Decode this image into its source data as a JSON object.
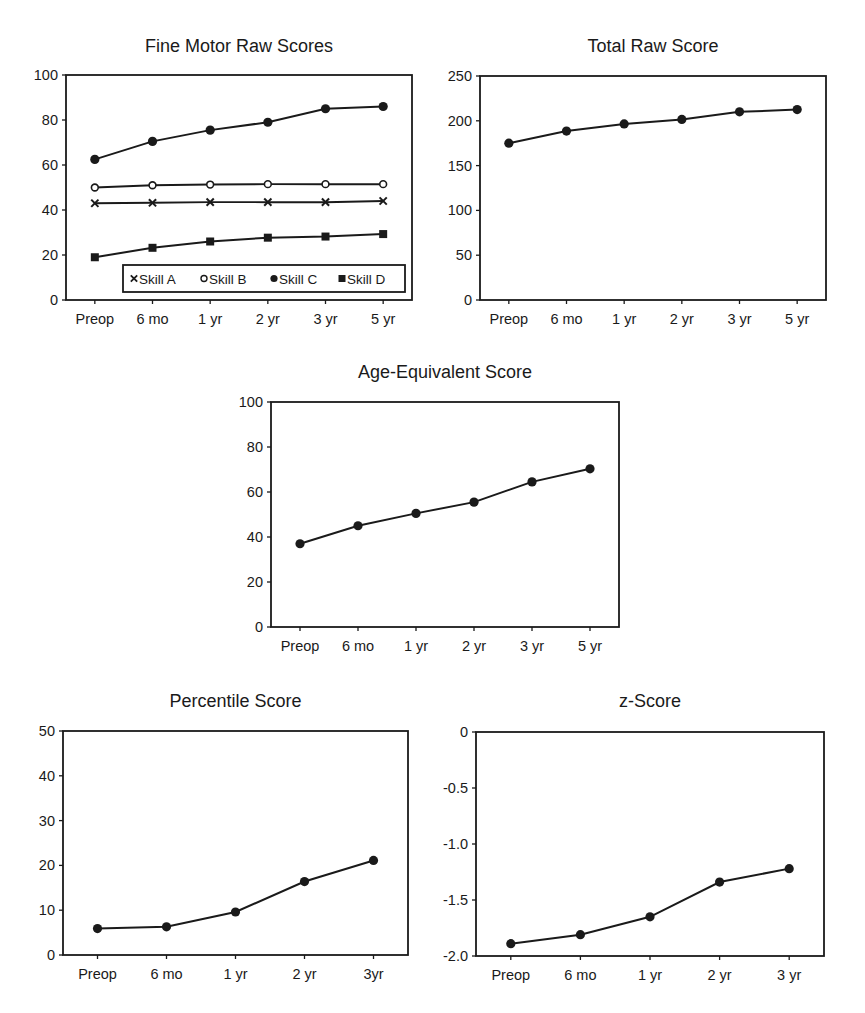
{
  "chart_data": [
    {
      "id": "fine-motor",
      "type": "line",
      "title": "Fine Motor Raw Scores",
      "xlabel": "",
      "ylabel": "",
      "categories": [
        "Preop",
        "6 mo",
        "1 yr",
        "2 yr",
        "3 yr",
        "5 yr"
      ],
      "ylim": [
        0,
        100
      ],
      "yticks": [
        0,
        20,
        40,
        60,
        80,
        100
      ],
      "ytick_labels": [
        "0",
        "20",
        "40",
        "60",
        "80",
        "100"
      ],
      "grid": false,
      "legend": {
        "placement": "bottom-right",
        "orientation": "horizontal"
      },
      "series": [
        {
          "name": "Skill A",
          "marker": "x",
          "values": [
            43,
            43.2,
            43.5,
            43.5,
            43.5,
            44
          ]
        },
        {
          "name": "Skill B",
          "marker": "open-circle",
          "values": [
            50,
            51,
            51.3,
            51.5,
            51.5,
            51.5
          ]
        },
        {
          "name": "Skill C",
          "marker": "filled-circle",
          "values": [
            62.5,
            70.5,
            75.5,
            79,
            85,
            86
          ]
        },
        {
          "name": "Skill D",
          "marker": "filled-square",
          "values": [
            19,
            23.2,
            26,
            27.7,
            28.2,
            29.3
          ]
        }
      ]
    },
    {
      "id": "total-raw",
      "type": "line",
      "title": "Total Raw Score",
      "xlabel": "",
      "ylabel": "",
      "categories": [
        "Preop",
        "6 mo",
        "1 yr",
        "2 yr",
        "3 yr",
        "5 yr"
      ],
      "ylim": [
        0,
        250
      ],
      "yticks": [
        0,
        50,
        100,
        150,
        200,
        250
      ],
      "ytick_labels": [
        "0",
        "50",
        "100",
        "150",
        "200",
        "250"
      ],
      "grid": false,
      "series": [
        {
          "name": "Total Raw Score",
          "marker": "filled-circle",
          "values": [
            175,
            188.5,
            196.5,
            201.5,
            210,
            212.5
          ]
        }
      ]
    },
    {
      "id": "age-equivalent",
      "type": "line",
      "title": "Age-Equivalent Score",
      "xlabel": "",
      "ylabel": "",
      "categories": [
        "Preop",
        "6 mo",
        "1 yr",
        "2 yr",
        "3 yr",
        "5 yr"
      ],
      "ylim": [
        0,
        100
      ],
      "yticks": [
        0,
        20,
        40,
        60,
        80,
        100
      ],
      "ytick_labels": [
        "0",
        "20",
        "40",
        "60",
        "80",
        "100"
      ],
      "grid": false,
      "series": [
        {
          "name": "Age-Equivalent Score",
          "marker": "filled-circle",
          "values": [
            37,
            45,
            50.5,
            55.5,
            64.5,
            70.3
          ]
        }
      ]
    },
    {
      "id": "percentile",
      "type": "line",
      "title": "Percentile Score",
      "xlabel": "",
      "ylabel": "",
      "categories": [
        "Preop",
        "6 mo",
        "1 yr",
        "2 yr",
        "3yr"
      ],
      "ylim": [
        0,
        50
      ],
      "yticks": [
        0,
        10,
        20,
        30,
        40,
        50
      ],
      "ytick_labels": [
        "0",
        "10",
        "20",
        "30",
        "40",
        "50"
      ],
      "grid": false,
      "series": [
        {
          "name": "Percentile Score",
          "marker": "filled-circle",
          "values": [
            5.9,
            6.3,
            9.6,
            16.4,
            21.1
          ]
        }
      ]
    },
    {
      "id": "z-score",
      "type": "line",
      "title": "z-Score",
      "xlabel": "",
      "ylabel": "",
      "categories": [
        "Preop",
        "6 mo",
        "1 yr",
        "2 yr",
        "3 yr"
      ],
      "ylim": [
        -2.0,
        0
      ],
      "yticks": [
        -2.0,
        -1.5,
        -1.0,
        -0.5,
        0
      ],
      "ytick_labels": [
        "-2.0",
        "-1.5",
        "-1.0",
        "-0.5",
        "0"
      ],
      "grid": false,
      "series": [
        {
          "name": "z-Score",
          "marker": "filled-circle",
          "values": [
            -1.89,
            -1.81,
            -1.65,
            -1.34,
            -1.22
          ]
        }
      ]
    }
  ]
}
